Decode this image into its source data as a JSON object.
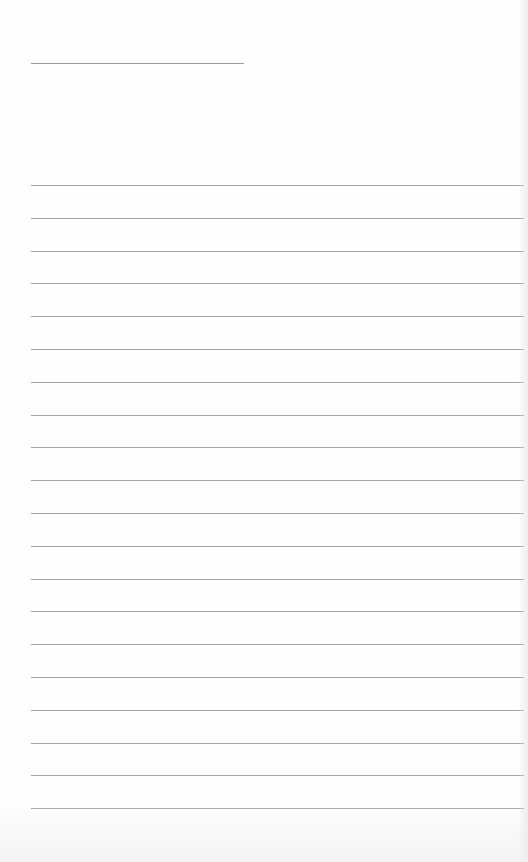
{
  "page": {
    "type": "lined-paper",
    "header_line": {
      "present": true
    },
    "ruled_lines": {
      "count": 20,
      "first_top_px": 185,
      "spacing_px": 32.8
    },
    "colors": {
      "paper": "#fefefe",
      "line": "#a4a4a4",
      "header_line": "#9a9a9a"
    }
  }
}
